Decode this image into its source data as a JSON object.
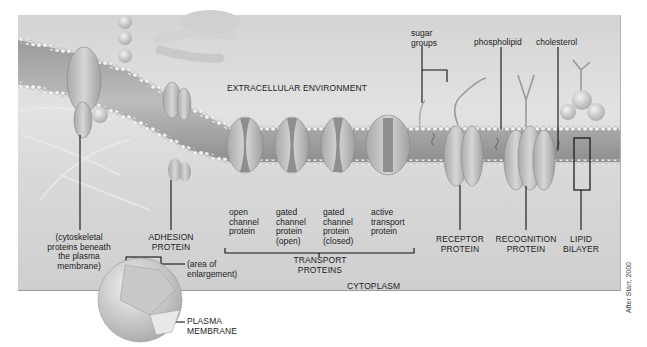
{
  "diagram": {
    "regions": {
      "extracellular": "EXTRACELLULAR ENVIRONMENT",
      "cytoplasm": "CYTOPLASM"
    },
    "labels": {
      "sugar_groups": "sugar\ngroups",
      "phospholipid": "phospholipid",
      "cholesterol": "cholesterol",
      "cytoskeletal": "(cytoskeletal\nproteins beneath\nthe plasma\nmembrane)",
      "adhesion": "ADHESION\nPROTEIN",
      "area_enlargement": "(area of\nenlargement)",
      "plasma_membrane": "PLASMA\nMEMBRANE",
      "open_channel": "open\nchannel\nprotein",
      "gated_open": "gated\nchannel\nprotein\n(open)",
      "gated_closed": "gated\nchannel\nprotein\n(closed)",
      "active_transport": "active\ntransport\nprotein",
      "transport_proteins": "TRANSPORT\nPROTEINS",
      "receptor": "RECEPTOR\nPROTEIN",
      "recognition": "RECOGNITION\nPROTEIN",
      "lipid_bilayer": "LIPID\nBILAYER"
    },
    "credit": "After Starr, 2000"
  }
}
